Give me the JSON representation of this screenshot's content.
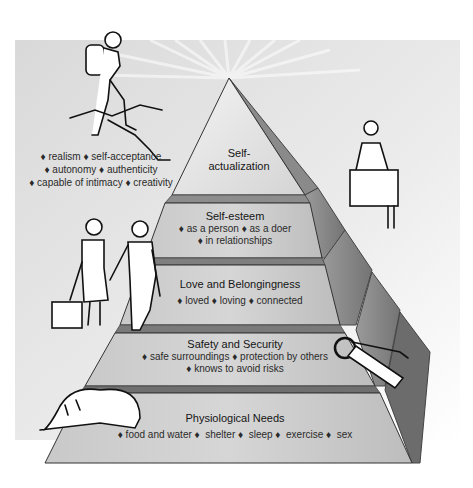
{
  "diagram": {
    "type": "pyramid",
    "colors": {
      "background_panel": "#e6e6e6",
      "tier_front_light": "#d8d8d8",
      "tier_front_dark": "#b4b4b4",
      "right_facet": "#8c8c8c",
      "right_facet_dark": "#6e6e6e",
      "separator": "#7a7a7a",
      "text": "#1e1e1e"
    },
    "tiers": [
      {
        "level": 5,
        "title": "Self-actualization",
        "title_line1": "Self-",
        "title_line2": "actualization",
        "items": []
      },
      {
        "level": 4,
        "title": "Self-esteem",
        "items": [
          "as a person",
          "as a doer",
          "in relationships"
        ],
        "line1": "♦ as a person ♦ as a doer",
        "line2": "♦ in relationships"
      },
      {
        "level": 3,
        "title": "Love and Belongingness",
        "items": [
          "loved",
          "loving",
          "connected"
        ],
        "line1": "♦ loved ♦ loving ♦ connected"
      },
      {
        "level": 2,
        "title": "Safety and Security",
        "items": [
          "safe surroundings",
          "protection by others",
          "knows to avoid risks"
        ],
        "line1": "♦ safe surroundings ♦ protection by others",
        "line2": "♦ knows to avoid risks"
      },
      {
        "level": 1,
        "title": "Physiological Needs",
        "items": [
          "food and water",
          "shelter",
          "sleep",
          "exercise",
          "sex"
        ],
        "line1": "♦ food and water ♦  shelter ♦  sleep ♦  exercise ♦  sex"
      }
    ],
    "self_actualization_traits": {
      "items": [
        "realism",
        "self-acceptance",
        "autonomy",
        "authenticity",
        "capable of intimacy",
        "creativity"
      ],
      "line1": "♦ realism ♦  self-acceptance",
      "line2": "♦  autonomy ♦  authenticity",
      "line3": "♦ capable of intimacy ♦ creativity"
    },
    "illustrations": [
      "hiker-climbing-illustration",
      "speaker-at-podium-illustration",
      "walking-couple-illustration",
      "keys-illustration",
      "sleeping-person-illustration"
    ]
  }
}
